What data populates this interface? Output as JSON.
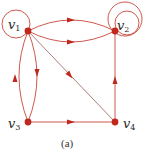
{
  "diagram": {
    "caption": "(a)",
    "colors": {
      "edge": "#c8453a",
      "diagonal_edge": "#a0706a",
      "node": "#c0281e",
      "loop": "#c8453a",
      "label": "#2a2a2a"
    },
    "nodes": [
      {
        "id": "v1",
        "label_base": "v",
        "label_sub": "1",
        "x": 28,
        "y": 31
      },
      {
        "id": "v2",
        "label_base": "v",
        "label_sub": "2",
        "x": 115,
        "y": 31
      },
      {
        "id": "v3",
        "label_base": "v",
        "label_sub": "3",
        "x": 28,
        "y": 122
      },
      {
        "id": "v4",
        "label_base": "v",
        "label_sub": "4",
        "x": 115,
        "y": 122
      }
    ],
    "edges": [
      {
        "from": "v1",
        "to": "v1",
        "type": "self-loop"
      },
      {
        "from": "v1",
        "to": "v2",
        "type": "curved-upper"
      },
      {
        "from": "v1",
        "to": "v2",
        "type": "curved-lower"
      },
      {
        "from": "v2",
        "to": "v2",
        "type": "self-loop"
      },
      {
        "from": "v2",
        "to": "v2",
        "type": "self-loop"
      },
      {
        "from": "v1",
        "to": "v3",
        "type": "curved-right"
      },
      {
        "from": "v3",
        "to": "v1",
        "type": "curved-left"
      },
      {
        "from": "v1",
        "to": "v4",
        "type": "straight-diagonal"
      },
      {
        "from": "v3",
        "to": "v4",
        "type": "straight-horizontal"
      },
      {
        "from": "v4",
        "to": "v2",
        "type": "straight-vertical"
      }
    ]
  }
}
